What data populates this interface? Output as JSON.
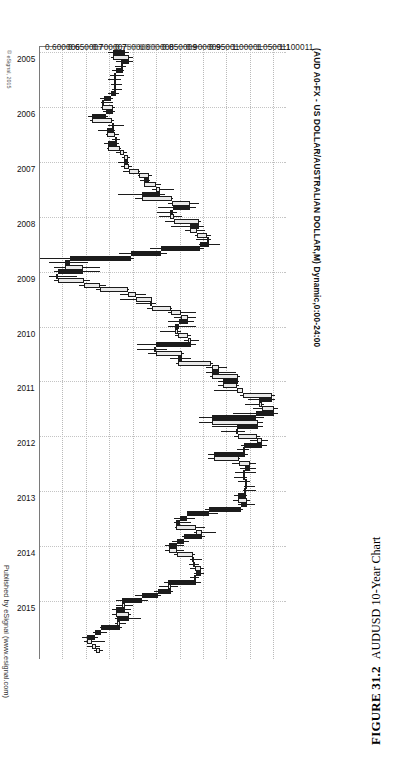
{
  "figure": {
    "number_label": "FIGURE 31.2",
    "caption": "AUDUSD 10-Year Chart"
  },
  "chart_header": {
    "title": "(AUD A0-FX - US DOLLAR/AUSTRALIAN DOLLAR,M) Dynamic,0:00-24:00",
    "credit": "Published by eSignal (www.esignal.com)",
    "copyright": "© eSignal, 2015"
  },
  "chart_data": {
    "type": "candlestick",
    "title": "(AUD A0-FX - US DOLLAR/AUSTRALIAN DOLLAR,M) Dynamic,0:00-24:00",
    "xlabel": "",
    "ylabel": "",
    "grid": true,
    "legend": "none",
    "orientation": "rotated-90-ccw",
    "instrument": "AUD A0-FX - US DOLLAR/AUSTRALIAN DOLLAR",
    "interval": "Monthly",
    "session": "Dynamic,0:00-24:00",
    "ylim": [
      0.600006,
      1.125
    ],
    "xlim": [
      "2005",
      "2015"
    ],
    "y_ticks": [
      "1.100011",
      "1.050011",
      "1.00001",
      "0.95001",
      "0.900009",
      "0.850009",
      "0.800008",
      "0.750008",
      "0.700007",
      "0.650007",
      "0.600006"
    ],
    "y_tick_values": [
      1.100011,
      1.050011,
      1.00001,
      0.95001,
      0.900009,
      0.850009,
      0.800008,
      0.750008,
      0.700007,
      0.650007,
      0.600006
    ],
    "price_marker": {
      "label": "0.77600",
      "value": 0.776,
      "color": "#9a9a9a"
    },
    "x_ticks": [
      "2005",
      "2006",
      "2007",
      "2008",
      "2009",
      "2010",
      "2011",
      "2012",
      "2013",
      "2014",
      "2015"
    ],
    "colors": {
      "up_body": "#e9e9e9",
      "down_body": "#1c1c1c",
      "outline": "#1c1c1c",
      "grid": "#c0c0c0",
      "axis": "#7a7a7a"
    },
    "candles": [
      {
        "t": "2005-01",
        "o": 0.7805,
        "h": 0.789,
        "l": 0.745,
        "c": 0.756
      },
      {
        "t": "2005-02",
        "o": 0.756,
        "h": 0.798,
        "l": 0.752,
        "c": 0.7905
      },
      {
        "t": "2005-03",
        "o": 0.7905,
        "h": 0.798,
        "l": 0.762,
        "c": 0.772
      },
      {
        "t": "2005-04",
        "o": 0.772,
        "h": 0.784,
        "l": 0.76,
        "c": 0.7775
      },
      {
        "t": "2005-05",
        "o": 0.7775,
        "h": 0.779,
        "l": 0.753,
        "c": 0.762
      },
      {
        "t": "2005-06",
        "o": 0.762,
        "h": 0.779,
        "l": 0.75,
        "c": 0.758
      },
      {
        "t": "2005-07",
        "o": 0.758,
        "h": 0.773,
        "l": 0.746,
        "c": 0.762
      },
      {
        "t": "2005-08",
        "o": 0.762,
        "h": 0.775,
        "l": 0.752,
        "c": 0.757
      },
      {
        "t": "2005-09",
        "o": 0.757,
        "h": 0.774,
        "l": 0.7535,
        "c": 0.763
      },
      {
        "t": "2005-10",
        "o": 0.763,
        "h": 0.768,
        "l": 0.745,
        "c": 0.7515
      },
      {
        "t": "2005-11",
        "o": 0.7515,
        "h": 0.756,
        "l": 0.727,
        "c": 0.737
      },
      {
        "t": "2005-12",
        "o": 0.737,
        "h": 0.755,
        "l": 0.731,
        "c": 0.733
      },
      {
        "t": "2006-01",
        "o": 0.733,
        "h": 0.76,
        "l": 0.73,
        "c": 0.756
      },
      {
        "t": "2006-02",
        "o": 0.756,
        "h": 0.76,
        "l": 0.735,
        "c": 0.74
      },
      {
        "t": "2006-03",
        "o": 0.74,
        "h": 0.745,
        "l": 0.703,
        "c": 0.71
      },
      {
        "t": "2006-04",
        "o": 0.71,
        "h": 0.758,
        "l": 0.706,
        "c": 0.7545
      },
      {
        "t": "2006-05",
        "o": 0.7545,
        "h": 0.78,
        "l": 0.745,
        "c": 0.757
      },
      {
        "t": "2006-06",
        "o": 0.757,
        "h": 0.759,
        "l": 0.723,
        "c": 0.742
      },
      {
        "t": "2006-07",
        "o": 0.742,
        "h": 0.768,
        "l": 0.74,
        "c": 0.761
      },
      {
        "t": "2006-08",
        "o": 0.761,
        "h": 0.77,
        "l": 0.753,
        "c": 0.764
      },
      {
        "t": "2006-09",
        "o": 0.764,
        "h": 0.769,
        "l": 0.737,
        "c": 0.746
      },
      {
        "t": "2006-10",
        "o": 0.746,
        "h": 0.773,
        "l": 0.742,
        "c": 0.771
      },
      {
        "t": "2006-11",
        "o": 0.771,
        "h": 0.785,
        "l": 0.762,
        "c": 0.779
      },
      {
        "t": "2006-12",
        "o": 0.779,
        "h": 0.793,
        "l": 0.774,
        "c": 0.788
      },
      {
        "t": "2007-01",
        "o": 0.788,
        "h": 0.789,
        "l": 0.766,
        "c": 0.779
      },
      {
        "t": "2007-02",
        "o": 0.779,
        "h": 0.796,
        "l": 0.772,
        "c": 0.789
      },
      {
        "t": "2007-03",
        "o": 0.789,
        "h": 0.813,
        "l": 0.778,
        "c": 0.811
      },
      {
        "t": "2007-04",
        "o": 0.811,
        "h": 0.84,
        "l": 0.81,
        "c": 0.833
      },
      {
        "t": "2007-05",
        "o": 0.833,
        "h": 0.835,
        "l": 0.813,
        "c": 0.822
      },
      {
        "t": "2007-06",
        "o": 0.822,
        "h": 0.859,
        "l": 0.821,
        "c": 0.848
      },
      {
        "t": "2007-07",
        "o": 0.848,
        "h": 0.887,
        "l": 0.838,
        "c": 0.857
      },
      {
        "t": "2007-08",
        "o": 0.857,
        "h": 0.867,
        "l": 0.767,
        "c": 0.817
      },
      {
        "t": "2007-09",
        "o": 0.817,
        "h": 0.883,
        "l": 0.803,
        "c": 0.882
      },
      {
        "t": "2007-10",
        "o": 0.882,
        "h": 0.94,
        "l": 0.874,
        "c": 0.92
      },
      {
        "t": "2007-11",
        "o": 0.92,
        "h": 0.932,
        "l": 0.851,
        "c": 0.883
      },
      {
        "t": "2007-12",
        "o": 0.883,
        "h": 0.893,
        "l": 0.85,
        "c": 0.878
      },
      {
        "t": "2008-01",
        "o": 0.878,
        "h": 0.902,
        "l": 0.854,
        "c": 0.887
      },
      {
        "t": "2008-02",
        "o": 0.887,
        "h": 0.943,
        "l": 0.867,
        "c": 0.94
      },
      {
        "t": "2008-03",
        "o": 0.94,
        "h": 0.95,
        "l": 0.879,
        "c": 0.921
      },
      {
        "t": "2008-04",
        "o": 0.921,
        "h": 0.953,
        "l": 0.909,
        "c": 0.935
      },
      {
        "t": "2008-05",
        "o": 0.935,
        "h": 0.966,
        "l": 0.93,
        "c": 0.956
      },
      {
        "t": "2008-06",
        "o": 0.956,
        "h": 0.966,
        "l": 0.933,
        "c": 0.96
      },
      {
        "t": "2008-07",
        "o": 0.96,
        "h": 0.985,
        "l": 0.94,
        "c": 0.942
      },
      {
        "t": "2008-08",
        "o": 0.942,
        "h": 0.949,
        "l": 0.834,
        "c": 0.859
      },
      {
        "t": "2008-09",
        "o": 0.859,
        "h": 0.871,
        "l": 0.769,
        "c": 0.794
      },
      {
        "t": "2008-10",
        "o": 0.794,
        "h": 0.8,
        "l": 0.601,
        "c": 0.665
      },
      {
        "t": "2008-11",
        "o": 0.665,
        "h": 0.703,
        "l": 0.62,
        "c": 0.654
      },
      {
        "t": "2008-12",
        "o": 0.654,
        "h": 0.727,
        "l": 0.629,
        "c": 0.691
      },
      {
        "t": "2009-01",
        "o": 0.691,
        "h": 0.727,
        "l": 0.629,
        "c": 0.638
      },
      {
        "t": "2009-02",
        "o": 0.638,
        "h": 0.678,
        "l": 0.62,
        "c": 0.639
      },
      {
        "t": "2009-03",
        "o": 0.639,
        "h": 0.707,
        "l": 0.629,
        "c": 0.694
      },
      {
        "t": "2009-04",
        "o": 0.694,
        "h": 0.74,
        "l": 0.683,
        "c": 0.728
      },
      {
        "t": "2009-05",
        "o": 0.728,
        "h": 0.79,
        "l": 0.719,
        "c": 0.787
      },
      {
        "t": "2009-06",
        "o": 0.787,
        "h": 0.826,
        "l": 0.77,
        "c": 0.805
      },
      {
        "t": "2009-07",
        "o": 0.805,
        "h": 0.84,
        "l": 0.77,
        "c": 0.838
      },
      {
        "t": "2009-08",
        "o": 0.838,
        "h": 0.848,
        "l": 0.804,
        "c": 0.84
      },
      {
        "t": "2009-09",
        "o": 0.84,
        "h": 0.881,
        "l": 0.829,
        "c": 0.88
      },
      {
        "t": "2009-10",
        "o": 0.88,
        "h": 0.933,
        "l": 0.874,
        "c": 0.9
      },
      {
        "t": "2009-11",
        "o": 0.9,
        "h": 0.933,
        "l": 0.887,
        "c": 0.915
      },
      {
        "t": "2009-12",
        "o": 0.915,
        "h": 0.928,
        "l": 0.873,
        "c": 0.897
      },
      {
        "t": "2010-01",
        "o": 0.897,
        "h": 0.933,
        "l": 0.873,
        "c": 0.888
      },
      {
        "t": "2010-02",
        "o": 0.888,
        "h": 0.901,
        "l": 0.857,
        "c": 0.894
      },
      {
        "t": "2010-03",
        "o": 0.894,
        "h": 0.923,
        "l": 0.888,
        "c": 0.916
      },
      {
        "t": "2010-04",
        "o": 0.916,
        "h": 0.94,
        "l": 0.908,
        "c": 0.923
      },
      {
        "t": "2010-05",
        "o": 0.923,
        "h": 0.933,
        "l": 0.807,
        "c": 0.848
      },
      {
        "t": "2010-06",
        "o": 0.848,
        "h": 0.872,
        "l": 0.807,
        "c": 0.848
      },
      {
        "t": "2010-07",
        "o": 0.848,
        "h": 0.908,
        "l": 0.831,
        "c": 0.903
      },
      {
        "t": "2010-08",
        "o": 0.903,
        "h": 0.922,
        "l": 0.877,
        "c": 0.894
      },
      {
        "t": "2010-09",
        "o": 0.894,
        "h": 0.969,
        "l": 0.891,
        "c": 0.966
      },
      {
        "t": "2010-10",
        "o": 0.966,
        "h": 1.0,
        "l": 0.954,
        "c": 0.983
      },
      {
        "t": "2010-11",
        "o": 0.983,
        "h": 1.018,
        "l": 0.954,
        "c": 0.967
      },
      {
        "t": "2010-12",
        "o": 0.967,
        "h": 1.026,
        "l": 0.963,
        "c": 1.023
      },
      {
        "t": "2011-01",
        "o": 1.023,
        "h": 1.025,
        "l": 0.98,
        "c": 0.99
      },
      {
        "t": "2011-02",
        "o": 0.99,
        "h": 1.025,
        "l": 0.98,
        "c": 1.02
      },
      {
        "t": "2011-03",
        "o": 1.02,
        "h": 1.034,
        "l": 0.971,
        "c": 1.033
      },
      {
        "t": "2011-04",
        "o": 1.033,
        "h": 1.101,
        "l": 1.027,
        "c": 1.095
      },
      {
        "t": "2011-05",
        "o": 1.095,
        "h": 1.101,
        "l": 1.044,
        "c": 1.068
      },
      {
        "t": "2011-06",
        "o": 1.068,
        "h": 1.079,
        "l": 1.038,
        "c": 1.073
      },
      {
        "t": "2011-07",
        "o": 1.073,
        "h": 1.108,
        "l": 1.055,
        "c": 1.099
      },
      {
        "t": "2011-08",
        "o": 1.099,
        "h": 1.108,
        "l": 1.011,
        "c": 1.06
      },
      {
        "t": "2011-09",
        "o": 1.06,
        "h": 1.077,
        "l": 0.939,
        "c": 0.968
      },
      {
        "t": "2011-10",
        "o": 0.968,
        "h": 1.075,
        "l": 0.939,
        "c": 1.065
      },
      {
        "t": "2011-11",
        "o": 1.065,
        "h": 1.075,
        "l": 0.966,
        "c": 1.021
      },
      {
        "t": "2011-12",
        "o": 1.021,
        "h": 1.038,
        "l": 0.987,
        "c": 1.023
      },
      {
        "t": "2012-01",
        "o": 1.023,
        "h": 1.069,
        "l": 1.015,
        "c": 1.063
      },
      {
        "t": "2012-02",
        "o": 1.063,
        "h": 1.086,
        "l": 1.048,
        "c": 1.074
      },
      {
        "t": "2012-03",
        "o": 1.074,
        "h": 1.085,
        "l": 1.028,
        "c": 1.035
      },
      {
        "t": "2012-04",
        "o": 1.035,
        "h": 1.047,
        "l": 1.021,
        "c": 1.038
      },
      {
        "t": "2012-05",
        "o": 1.038,
        "h": 1.044,
        "l": 0.958,
        "c": 0.972
      },
      {
        "t": "2012-06",
        "o": 0.972,
        "h": 1.026,
        "l": 0.958,
        "c": 1.024
      },
      {
        "t": "2012-07",
        "o": 1.024,
        "h": 1.06,
        "l": 1.01,
        "c": 1.049
      },
      {
        "t": "2012-08",
        "o": 1.049,
        "h": 1.061,
        "l": 1.027,
        "c": 1.038
      },
      {
        "t": "2012-09",
        "o": 1.038,
        "h": 1.06,
        "l": 1.017,
        "c": 1.037
      },
      {
        "t": "2012-10",
        "o": 1.037,
        "h": 1.042,
        "l": 1.015,
        "c": 1.037
      },
      {
        "t": "2012-11",
        "o": 1.037,
        "h": 1.049,
        "l": 1.023,
        "c": 1.041
      },
      {
        "t": "2012-12",
        "o": 1.041,
        "h": 1.059,
        "l": 1.036,
        "c": 1.038
      },
      {
        "t": "2013-01",
        "o": 1.038,
        "h": 1.06,
        "l": 1.034,
        "c": 1.039
      },
      {
        "t": "2013-02",
        "o": 1.039,
        "h": 1.042,
        "l": 1.015,
        "c": 1.023
      },
      {
        "t": "2013-03",
        "o": 1.023,
        "h": 1.049,
        "l": 1.012,
        "c": 1.041
      },
      {
        "t": "2013-04",
        "o": 1.041,
        "h": 1.058,
        "l": 1.022,
        "c": 1.029
      },
      {
        "t": "2013-05",
        "o": 1.029,
        "h": 1.033,
        "l": 0.953,
        "c": 0.96
      },
      {
        "t": "2013-06",
        "o": 0.96,
        "h": 0.979,
        "l": 0.914,
        "c": 0.914
      },
      {
        "t": "2013-07",
        "o": 0.914,
        "h": 0.93,
        "l": 0.885,
        "c": 0.898
      },
      {
        "t": "2013-08",
        "o": 0.898,
        "h": 0.923,
        "l": 0.885,
        "c": 0.891
      },
      {
        "t": "2013-09",
        "o": 0.891,
        "h": 0.953,
        "l": 0.889,
        "c": 0.933
      },
      {
        "t": "2013-10",
        "o": 0.933,
        "h": 0.975,
        "l": 0.929,
        "c": 0.946
      },
      {
        "t": "2013-11",
        "o": 0.946,
        "h": 0.952,
        "l": 0.903,
        "c": 0.908
      },
      {
        "t": "2013-12",
        "o": 0.908,
        "h": 0.917,
        "l": 0.882,
        "c": 0.892
      },
      {
        "t": "2014-01",
        "o": 0.892,
        "h": 0.908,
        "l": 0.866,
        "c": 0.875
      },
      {
        "t": "2014-02",
        "o": 0.875,
        "h": 0.908,
        "l": 0.866,
        "c": 0.893
      },
      {
        "t": "2014-03",
        "o": 0.893,
        "h": 0.93,
        "l": 0.886,
        "c": 0.926
      },
      {
        "t": "2014-04",
        "o": 0.926,
        "h": 0.946,
        "l": 0.92,
        "c": 0.928
      },
      {
        "t": "2014-05",
        "o": 0.928,
        "h": 0.94,
        "l": 0.919,
        "c": 0.931
      },
      {
        "t": "2014-06",
        "o": 0.931,
        "h": 0.95,
        "l": 0.921,
        "c": 0.943
      },
      {
        "t": "2014-07",
        "o": 0.943,
        "h": 0.95,
        "l": 0.929,
        "c": 0.933
      },
      {
        "t": "2014-08",
        "o": 0.933,
        "h": 0.94,
        "l": 0.92,
        "c": 0.933
      },
      {
        "t": "2014-09",
        "o": 0.933,
        "h": 0.944,
        "l": 0.865,
        "c": 0.874
      },
      {
        "t": "2014-10",
        "o": 0.874,
        "h": 0.894,
        "l": 0.854,
        "c": 0.88
      },
      {
        "t": "2014-11",
        "o": 0.88,
        "h": 0.883,
        "l": 0.844,
        "c": 0.851
      },
      {
        "t": "2014-12",
        "o": 0.851,
        "h": 0.858,
        "l": 0.803,
        "c": 0.817
      },
      {
        "t": "2015-01",
        "o": 0.817,
        "h": 0.83,
        "l": 0.762,
        "c": 0.776
      },
      {
        "t": "2015-02",
        "o": 0.776,
        "h": 0.798,
        "l": 0.762,
        "c": 0.781
      },
      {
        "t": "2015-03",
        "o": 0.781,
        "h": 0.794,
        "l": 0.753,
        "c": 0.762
      },
      {
        "t": "2015-04",
        "o": 0.762,
        "h": 0.794,
        "l": 0.753,
        "c": 0.79
      },
      {
        "t": "2015-05",
        "o": 0.79,
        "h": 0.816,
        "l": 0.759,
        "c": 0.765
      },
      {
        "t": "2015-06",
        "o": 0.765,
        "h": 0.784,
        "l": 0.759,
        "c": 0.77
      },
      {
        "t": "2015-07",
        "o": 0.77,
        "h": 0.775,
        "l": 0.728,
        "c": 0.731
      },
      {
        "t": "2015-08",
        "o": 0.731,
        "h": 0.744,
        "l": 0.714,
        "c": 0.717
      },
      {
        "t": "2015-09",
        "o": 0.717,
        "h": 0.723,
        "l": 0.69,
        "c": 0.701
      },
      {
        "t": "2015-10",
        "o": 0.701,
        "h": 0.738,
        "l": 0.694,
        "c": 0.712
      },
      {
        "t": "2015-11",
        "o": 0.712,
        "h": 0.728,
        "l": 0.701,
        "c": 0.72
      },
      {
        "t": "2015-12",
        "o": 0.72,
        "h": 0.734,
        "l": 0.716,
        "c": 0.729
      }
    ]
  }
}
